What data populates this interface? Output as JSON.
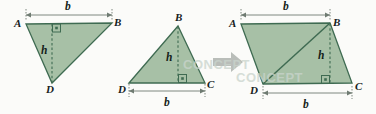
{
  "figure": {
    "colors": {
      "fill": "#a7c0a6",
      "stroke": "#3f6b52",
      "dimension_line": "#6f7b72",
      "arrow": "#b9bdb9",
      "label": "#16211c",
      "background": "#fbfbf9",
      "watermark": "#c9d4cc"
    },
    "panels": [
      {
        "id": "left-triangle",
        "name": "triangle-ABD",
        "vertex_labels": [
          "A",
          "B",
          "D"
        ],
        "dimension_labels": [
          "b",
          "h"
        ],
        "has_right_angle_marker": true
      },
      {
        "id": "middle-triangle",
        "name": "triangle-DBC",
        "vertex_labels": [
          "B",
          "D",
          "C"
        ],
        "dimension_labels": [
          "h",
          "b"
        ],
        "has_right_angle_marker": true
      },
      {
        "id": "right-parallelogram",
        "name": "parallelogram-ABCD",
        "vertex_labels": [
          "A",
          "B",
          "D",
          "C"
        ],
        "dimension_labels": [
          "b",
          "h",
          "b"
        ],
        "has_right_angle_marker": true
      }
    ],
    "transform_arrow": "right-arrow"
  },
  "labels": {
    "left": {
      "A": "A",
      "B": "B",
      "D": "D",
      "b": "b",
      "h": "h"
    },
    "middle": {
      "B": "B",
      "D": "D",
      "C": "C",
      "b": "b",
      "h": "h"
    },
    "right": {
      "A": "A",
      "B": "B",
      "D": "D",
      "C": "C",
      "b_top": "b",
      "b_bottom": "b",
      "h": "h"
    }
  },
  "watermark": {
    "text": "CONCEPT"
  }
}
